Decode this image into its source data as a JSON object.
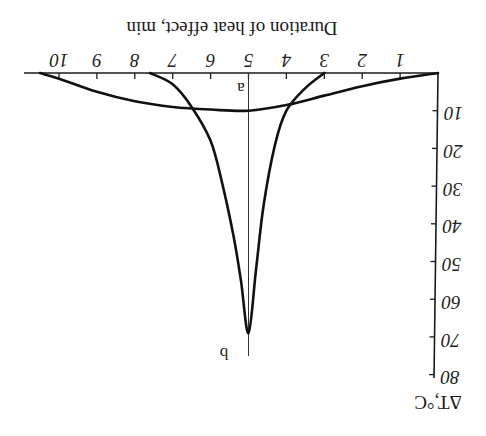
{
  "chart_data": {
    "type": "line",
    "orientation_note": "figure is rendered rotated 180 degrees",
    "title": "",
    "xlabel": "Duration of heat effect, min",
    "ylabel": "ΔT,°C",
    "x_ticks": [
      1,
      2,
      3,
      4,
      5,
      6,
      7,
      8,
      9,
      10
    ],
    "y_ticks": [
      10,
      20,
      30,
      40,
      50,
      60,
      70,
      80
    ],
    "xlim": [
      0,
      10.7
    ],
    "ylim": [
      0,
      80
    ],
    "grid": false,
    "legend": "none (curves labeled a and b on center line at t=5)",
    "series": [
      {
        "name": "a",
        "x": [
          0,
          1,
          2,
          3,
          4,
          5,
          6,
          7,
          8,
          9,
          10,
          10.5
        ],
        "y": [
          0,
          1.5,
          3.5,
          6,
          8.5,
          10,
          9.7,
          9,
          7.5,
          5,
          1.5,
          0
        ]
      },
      {
        "name": "b",
        "x": [
          3,
          3.5,
          4,
          4.3,
          4.6,
          4.8,
          5,
          5.2,
          5.4,
          5.7,
          6,
          6.5,
          7,
          7.6
        ],
        "y": [
          0,
          4,
          10,
          19,
          35,
          52,
          69,
          55,
          43,
          29,
          18,
          9,
          3,
          0
        ]
      }
    ],
    "annotations": [
      {
        "text": "a",
        "x": 5,
        "y": 4
      },
      {
        "text": "b",
        "x": 5,
        "y": 73
      }
    ]
  },
  "labels": {
    "xlabel": "Duration of heat effect, min",
    "ylabel": "ΔT,°C",
    "curve_a": "a",
    "curve_b": "b",
    "x_ticks": [
      "1",
      "2",
      "3",
      "4",
      "5",
      "6",
      "7",
      "8",
      "9",
      "10"
    ],
    "y_ticks": [
      "10",
      "20",
      "30",
      "40",
      "50",
      "60",
      "70",
      "80"
    ]
  }
}
